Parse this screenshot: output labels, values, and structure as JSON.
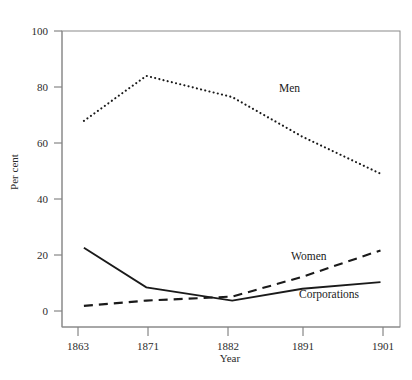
{
  "chart_data": {
    "type": "line",
    "title": "",
    "xlabel": "Year",
    "ylabel": "Per cent",
    "x": [
      1863,
      1871,
      1882,
      1891,
      1901
    ],
    "categories": [
      "1863",
      "1871",
      "1882",
      "1891",
      "1901"
    ],
    "xtick_labels": [
      "1863",
      "1871",
      "1882",
      "1891",
      "1901"
    ],
    "ytick_labels": [
      "0",
      "20",
      "40",
      "60",
      "80",
      "100"
    ],
    "yticks": [
      0,
      20,
      40,
      60,
      80,
      100
    ],
    "ylim": [
      -6,
      106
    ],
    "xlim": [
      1860.2,
      1903.5
    ],
    "grid": false,
    "legend_position": "inline-annotations",
    "series": [
      {
        "name": "Men",
        "style": "dotted",
        "color": "#1a1a1a",
        "values": [
          72,
          89,
          81,
          66,
          52
        ]
      },
      {
        "name": "Women",
        "style": "dashed",
        "color": "#1a1a1a",
        "values": [
          2,
          4,
          5.5,
          13,
          23
        ]
      },
      {
        "name": "Corporations",
        "style": "solid",
        "color": "#1a1a1a",
        "values": [
          24,
          9,
          4,
          8.5,
          11
        ]
      }
    ],
    "annotations": [
      {
        "text": "Men",
        "x": 1891,
        "y": 79
      },
      {
        "text": "Women",
        "x": 1889,
        "y": 22
      },
      {
        "text": "Corporations",
        "x": 1896,
        "y": 7
      }
    ]
  },
  "axes": {
    "y_title": "Per cent",
    "x_title": "Year"
  }
}
